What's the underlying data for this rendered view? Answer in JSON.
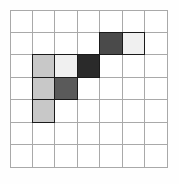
{
  "figure": {
    "type": "grid",
    "background_color": "#fefefe",
    "gridline_color": "#a9a9a9",
    "cell_outline_color": "#1a1a1a",
    "columns": 7,
    "rows": 7,
    "empty_color": "#ffffff"
  },
  "chart_data": {
    "type": "heatmap",
    "title": "",
    "xlabel": "",
    "ylabel": "",
    "columns": 7,
    "rows": 7,
    "grid": true,
    "legend": "none",
    "palette": {
      "empty": "#ffffff",
      "very-light-gray": "#f0f0f0",
      "light-gray": "#c8c8c8",
      "medium-dark-gray": "#5a5a5a",
      "dark-gray": "#4a4a4a",
      "very-dark-gray": "#2a2a2a"
    },
    "cells": [
      {
        "col": 4,
        "row": 1,
        "color": "#4a4a4a",
        "shade": "dark-gray"
      },
      {
        "col": 5,
        "row": 1,
        "color": "#f0f0f0",
        "shade": "very-light-gray"
      },
      {
        "col": 1,
        "row": 2,
        "color": "#c8c8c8",
        "shade": "light-gray"
      },
      {
        "col": 2,
        "row": 2,
        "color": "#f0f0f0",
        "shade": "very-light-gray"
      },
      {
        "col": 3,
        "row": 2,
        "color": "#2a2a2a",
        "shade": "very-dark-gray"
      },
      {
        "col": 1,
        "row": 3,
        "color": "#c8c8c8",
        "shade": "light-gray"
      },
      {
        "col": 2,
        "row": 3,
        "color": "#5a5a5a",
        "shade": "medium-dark-gray"
      },
      {
        "col": 1,
        "row": 4,
        "color": "#c8c8c8",
        "shade": "light-gray"
      }
    ]
  }
}
